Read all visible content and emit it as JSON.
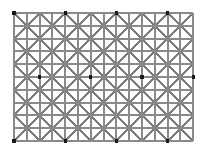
{
  "figure": {
    "kind": "optical-illusion-figure",
    "name": "Ninio extinction illusion",
    "alt_text": "Gray grid of horizontal, vertical and diagonal lines with small black dots at alternating intersections",
    "canvas": {
      "width": 205,
      "height": 159,
      "background": "#ffffff"
    }
  },
  "colors": {
    "background": "#ffffff",
    "grid_line": "#8a8a8a",
    "diagonal_line": "#7c7c7c",
    "dot": "#1a1a1a"
  },
  "geometry": {
    "plot_left": 14,
    "plot_top": 13,
    "plot_right": 193,
    "plot_bottom": 142,
    "fine_cell": 12.8,
    "coarse_cell": 25.6,
    "fine_columns": 14,
    "fine_rows": 10,
    "coarse_columns": 7,
    "coarse_rows": 5,
    "grid_line_width": 1.9,
    "diagonal_line_width": 2.0,
    "dot_size": 3.2
  },
  "chart_data": {
    "type": "scatter",
    "xlabel": "",
    "ylabel": "",
    "grid": true,
    "legend": "none",
    "xlim": [
      0,
      14
    ],
    "ylim": [
      0,
      10
    ],
    "vertical_lines_x": [
      0,
      1,
      2,
      3,
      4,
      5,
      6,
      7,
      8,
      9,
      10,
      11,
      12,
      13,
      14
    ],
    "horizontal_lines_y": [
      0,
      1,
      2,
      3,
      4,
      5,
      6,
      7,
      8,
      9,
      10
    ],
    "node_x": [
      0,
      2,
      4,
      6,
      8,
      10,
      12,
      14
    ],
    "node_y": [
      0,
      2,
      4,
      6,
      8,
      10
    ],
    "dots": [
      {
        "x": 0,
        "y": 0
      },
      {
        "x": 4,
        "y": 0
      },
      {
        "x": 8,
        "y": 0
      },
      {
        "x": 12,
        "y": 0
      },
      {
        "x": 2,
        "y": 5
      },
      {
        "x": 6,
        "y": 5
      },
      {
        "x": 10,
        "y": 5
      },
      {
        "x": 14,
        "y": 5
      },
      {
        "x": 0,
        "y": 10
      },
      {
        "x": 4,
        "y": 10
      },
      {
        "x": 8,
        "y": 10
      },
      {
        "x": 12,
        "y": 10
      }
    ],
    "dot_count": 12
  }
}
